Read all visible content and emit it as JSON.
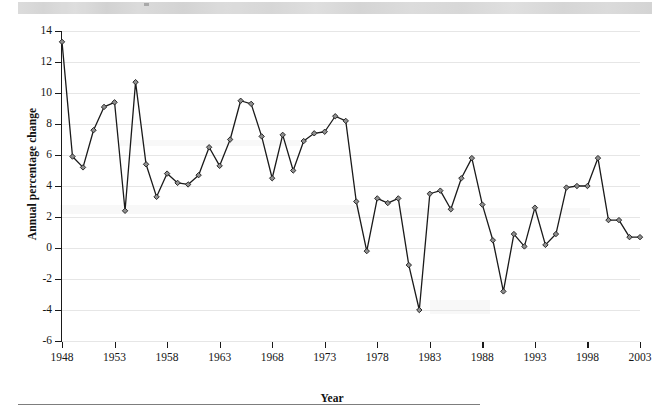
{
  "page": {
    "bottom_rule": "horizontal-rule"
  },
  "chart_data": {
    "type": "line",
    "title": "",
    "xlabel": "Year",
    "ylabel": "Annual percentage change",
    "xlim": [
      1948,
      2003
    ],
    "ylim": [
      -6,
      14
    ],
    "ytick_values": [
      14,
      12,
      10,
      8,
      6,
      4,
      2,
      0,
      -2,
      -4,
      -6
    ],
    "ytick_labels": [
      "14",
      "12",
      "10",
      "8",
      "6",
      "4",
      "2",
      "0",
      "-2",
      "-4",
      "-6"
    ],
    "xtick_values": [
      1948,
      1953,
      1958,
      1963,
      1968,
      1973,
      1978,
      1983,
      1988,
      1993,
      1998,
      2003
    ],
    "xtick_labels": [
      "1948",
      "1953",
      "1958",
      "1963",
      "1968",
      "1973",
      "1978",
      "1983",
      "1988",
      "1993",
      "1998",
      "2003"
    ],
    "grid": "horizontal",
    "legend": "none",
    "marker": "diamond",
    "line_color": "#1a1a1a",
    "marker_fill": "#8f8f8f",
    "marker_stroke": "#1a1a1a",
    "grid_color": "#e6e6e6",
    "x": [
      1948,
      1949,
      1950,
      1951,
      1952,
      1953,
      1954,
      1955,
      1956,
      1957,
      1958,
      1959,
      1960,
      1961,
      1962,
      1963,
      1964,
      1965,
      1966,
      1967,
      1968,
      1969,
      1970,
      1971,
      1972,
      1973,
      1974,
      1975,
      1976,
      1977,
      1978,
      1979,
      1980,
      1981,
      1982,
      1983,
      1984,
      1985,
      1986,
      1987,
      1988,
      1989,
      1990,
      1991,
      1992,
      1993,
      1994,
      1995,
      1996,
      1997,
      1998,
      1999,
      2000,
      2001,
      2002,
      2003
    ],
    "y": [
      13.3,
      5.9,
      5.2,
      7.6,
      9.1,
      9.4,
      2.4,
      10.7,
      5.4,
      3.3,
      4.8,
      4.2,
      4.1,
      4.7,
      6.5,
      5.3,
      7.0,
      9.5,
      9.3,
      7.2,
      4.5,
      7.3,
      5.0,
      6.9,
      7.4,
      7.5,
      8.5,
      8.2,
      3.0,
      -0.2,
      3.2,
      2.9,
      3.2,
      -1.1,
      -4.0,
      3.5,
      3.7,
      2.5,
      4.5,
      5.8,
      2.8,
      0.5,
      -2.8,
      0.9,
      0.1,
      2.6,
      0.2,
      0.9,
      3.9,
      4.0,
      4.0,
      5.8,
      1.8,
      1.8,
      0.7,
      0.7
    ],
    "series": [
      {
        "name": "Annual percentage change",
        "values": [
          13.3,
          5.9,
          5.2,
          7.6,
          9.1,
          9.4,
          2.4,
          10.7,
          5.4,
          3.3,
          4.8,
          4.2,
          4.1,
          4.7,
          6.5,
          5.3,
          7.0,
          9.5,
          9.3,
          7.2,
          4.5,
          7.3,
          5.0,
          6.9,
          7.4,
          7.5,
          8.5,
          8.2,
          3.0,
          -0.2,
          3.2,
          2.9,
          3.2,
          -1.1,
          -4.0,
          3.5,
          3.7,
          2.5,
          4.5,
          5.8,
          2.8,
          0.5,
          -2.8,
          0.9,
          0.1,
          2.6,
          0.2,
          0.9,
          3.9,
          4.0,
          4.0,
          5.8,
          1.8,
          1.8,
          0.7,
          0.7
        ]
      }
    ]
  }
}
